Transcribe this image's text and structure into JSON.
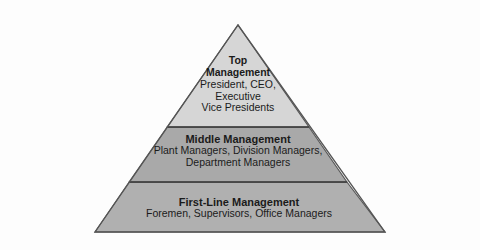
{
  "diagram": {
    "type": "pyramid",
    "background_color": "#fdfdfd",
    "outline_color": "#555555",
    "divider_color": "#3d3d3d",
    "text_color": "#1b1b1b",
    "geometry": {
      "apex_x": 238,
      "apex_y": 25,
      "base_left_x": 95,
      "base_right_x": 385,
      "base_y": 232,
      "divider_1_y": 127,
      "divider_2_y": 182
    },
    "tiers": [
      {
        "id": "top",
        "title": "Top Management",
        "title_lines": [
          "Top",
          "Management"
        ],
        "description_lines": [
          "President, CEO,",
          "Executive",
          "Vice Presidents"
        ],
        "fill_color": "#d6d6d6"
      },
      {
        "id": "middle",
        "title": "Middle Management",
        "title_lines": [
          "Middle Management"
        ],
        "description_lines": [
          "Plant Managers, Division Managers,",
          "Department Managers"
        ],
        "fill_color": "#a9a9a9"
      },
      {
        "id": "bottom",
        "title": "First-Line Management",
        "title_lines": [
          "First-Line Management"
        ],
        "description_lines": [
          "Foremen, Supervisors, Office Managers"
        ],
        "fill_color": "#b0b0b0"
      }
    ]
  }
}
